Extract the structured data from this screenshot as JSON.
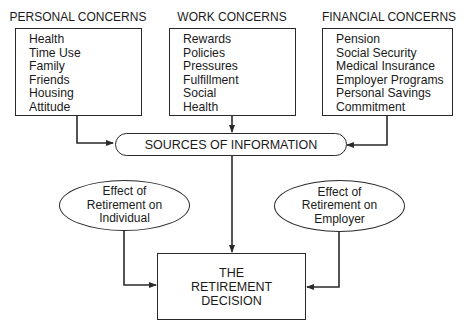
{
  "diagram": {
    "personal": {
      "title": "PERSONAL CONCERNS",
      "items": [
        "Health",
        "Time Use",
        "Family",
        "Friends",
        "Housing",
        "Attitude"
      ]
    },
    "work": {
      "title": "WORK CONCERNS",
      "items": [
        "Rewards",
        "Policies",
        "Pressures",
        "Fulfillment",
        "Social",
        "Health"
      ]
    },
    "financial": {
      "title": "FINANCIAL CONCERNS",
      "items": [
        "Pension",
        "Social Security",
        "Medical Insurance",
        "Employer Programs",
        "Personal Savings",
        "Commitment"
      ]
    },
    "sources": {
      "label": "SOURCES OF INFORMATION"
    },
    "effect_individual": {
      "lines": [
        "Effect of",
        "Retirement on",
        "Individual"
      ]
    },
    "effect_employer": {
      "lines": [
        "Effect of",
        "Retirement on",
        "Employer"
      ]
    },
    "decision": {
      "lines": [
        "THE",
        "RETIREMENT",
        "DECISION"
      ]
    },
    "edges": [
      {
        "from": "personal",
        "to": "sources"
      },
      {
        "from": "work",
        "to": "sources"
      },
      {
        "from": "financial",
        "to": "sources"
      },
      {
        "from": "sources",
        "to": "decision"
      },
      {
        "from": "effect_individual",
        "to": "decision"
      },
      {
        "from": "effect_employer",
        "to": "decision"
      }
    ],
    "colors": {
      "line": "#2a2a2a",
      "background": "#ffffff"
    }
  }
}
